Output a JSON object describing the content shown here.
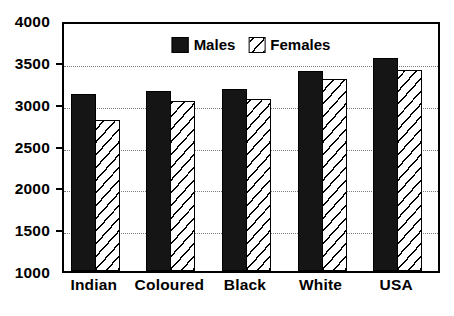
{
  "chart_data": {
    "type": "bar",
    "title": "",
    "subtitle": "",
    "xlabel": "",
    "ylabel": "",
    "categories": [
      "Indian",
      "Coloured",
      "Black",
      "White",
      "USA"
    ],
    "series": [
      {
        "name": "Males",
        "values": [
          3120,
          3150,
          3180,
          3390,
          3550
        ],
        "color": "#151515",
        "fill": "solid"
      },
      {
        "name": "Females",
        "values": [
          2810,
          3030,
          3050,
          3290,
          3400
        ],
        "color": "#ffffff",
        "fill": "diagonal-hatch"
      }
    ],
    "ylim": [
      1000,
      4000
    ],
    "yticks": [
      1000,
      1500,
      2000,
      2500,
      3000,
      3500,
      4000
    ],
    "ytick_labels": [
      "1000",
      "1500",
      "2000",
      "2500",
      "3000",
      "3500",
      "4000"
    ],
    "grid": true,
    "grid_axis": "y",
    "grid_style": "dotted",
    "legend_position": "upper-center-inside",
    "legend_entries": [
      "Males",
      "Females"
    ],
    "frame": true,
    "background_color": "#ffffff",
    "axis_color": "#000000"
  }
}
